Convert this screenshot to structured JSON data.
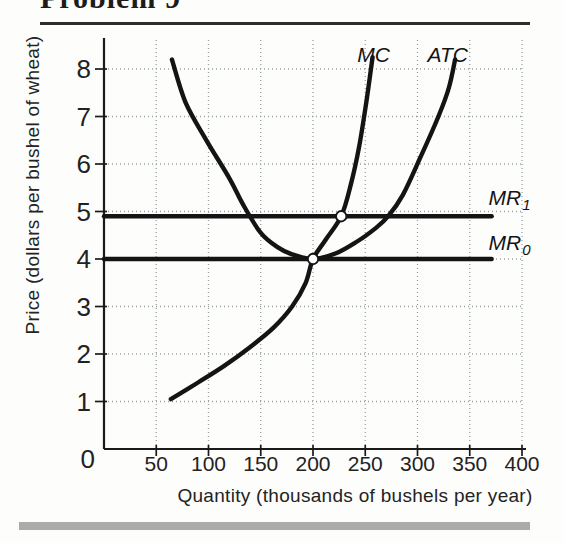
{
  "page": {
    "title": "Problem 9"
  },
  "chart_data": {
    "type": "line",
    "title": "Problem 9",
    "xlabel": "Quantity (thousands of bushels per year)",
    "ylabel": "Price (dollars per bushel of wheat)",
    "xlim": [
      0,
      405
    ],
    "ylim": [
      0,
      8.65
    ],
    "x_ticks": [
      50,
      100,
      150,
      200,
      250,
      300,
      350,
      400
    ],
    "y_ticks": [
      0,
      1,
      2,
      3,
      4,
      5,
      6,
      7,
      8
    ],
    "grid": "dotted",
    "legend_position": "inline-labels",
    "series": [
      {
        "name": "MC",
        "kind": "curve",
        "label": {
          "text": "MC"
        },
        "label_at": [
          258,
          8.15
        ],
        "label_anchor": "middle",
        "points": [
          [
            64,
            1.05
          ],
          [
            90,
            1.4
          ],
          [
            115,
            1.75
          ],
          [
            140,
            2.15
          ],
          [
            162,
            2.55
          ],
          [
            180,
            3.0
          ],
          [
            193,
            3.5
          ],
          [
            200,
            4.0
          ],
          [
            212,
            4.4
          ],
          [
            227,
            4.9
          ],
          [
            236,
            5.55
          ],
          [
            244,
            6.35
          ],
          [
            251,
            7.3
          ],
          [
            257,
            8.25
          ]
        ]
      },
      {
        "name": "ATC",
        "kind": "curve",
        "label": {
          "text": "ATC"
        },
        "label_at": [
          329,
          8.15
        ],
        "label_anchor": "middle",
        "points": [
          [
            65,
            8.2
          ],
          [
            78,
            7.3
          ],
          [
            98,
            6.5
          ],
          [
            120,
            5.7
          ],
          [
            133,
            5.15
          ],
          [
            150,
            4.55
          ],
          [
            166,
            4.25
          ],
          [
            180,
            4.1
          ],
          [
            200,
            4.0
          ],
          [
            222,
            4.12
          ],
          [
            243,
            4.38
          ],
          [
            260,
            4.65
          ],
          [
            272,
            4.9
          ],
          [
            286,
            5.35
          ],
          [
            303,
            6.15
          ],
          [
            320,
            7.0
          ],
          [
            330,
            7.6
          ],
          [
            336,
            8.2
          ]
        ]
      },
      {
        "name": "MR1",
        "kind": "hline",
        "y": 4.9,
        "x_range": [
          0,
          371
        ],
        "label": {
          "text": "MR",
          "sub": "1"
        },
        "label_at": [
          368,
          5.14
        ],
        "label_anchor": "start"
      },
      {
        "name": "MR0",
        "kind": "hline",
        "y": 4.0,
        "x_range": [
          0,
          371
        ],
        "label": {
          "text": "MR",
          "sub": "0"
        },
        "label_at": [
          368,
          4.19
        ],
        "label_anchor": "start"
      }
    ],
    "markers": [
      {
        "x": 200,
        "y": 4.0
      },
      {
        "x": 227,
        "y": 4.9
      }
    ],
    "colors": {
      "curve": "#141414",
      "grid": "#97a1a1",
      "axis": "#1a1a1a",
      "marker_fill": "#ffffff",
      "top_rule": "#2e2e2e",
      "bottom_bar": "#ababab"
    }
  }
}
